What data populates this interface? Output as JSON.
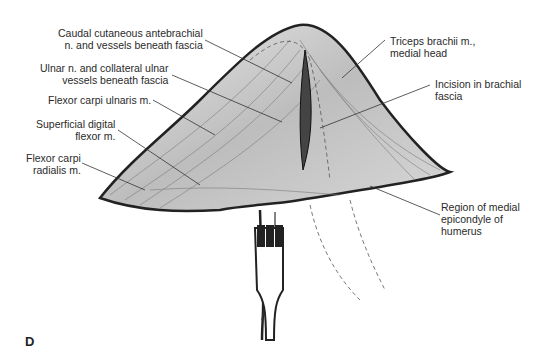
{
  "figure": {
    "panel_letter": "D",
    "labels": {
      "caudal_cutaneous": "Caudal cutaneous antebrachial\nn. and vessels beneath fascia",
      "ulnar": "Ulnar n. and collateral ulnar\nvessels beneath fascia",
      "flexor_carpi_ulnaris": "Flexor carpi ulnaris m.",
      "superficial_digital": "Superficial digital\nflexor m.",
      "flexor_carpi_radialis": "Flexor carpi\nradialis m.",
      "triceps": "Triceps brachii m.,\nmedial head",
      "incision": "Incision in brachial\nfascia",
      "epicondyle": "Region of medial\nepicondyle of\nhumerus"
    },
    "colors": {
      "ink": "#2a2a2a",
      "shade": "#8a8a8a",
      "background": "#ffffff"
    }
  }
}
